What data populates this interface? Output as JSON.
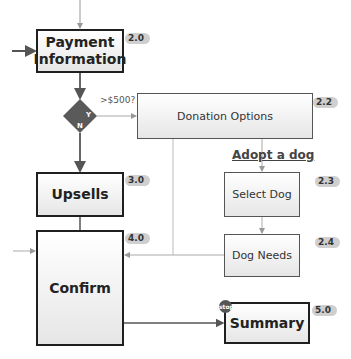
{
  "nodes": {
    "payment": {
      "label": "Payment Information",
      "line1": "Payment",
      "line2": "Information",
      "id": "2.0"
    },
    "decision": {
      "question": ">$500?",
      "yes": "Y",
      "no": "N"
    },
    "donation": {
      "label": "Donation Options",
      "id": "2.2"
    },
    "adopt_section": {
      "label": "Adopt a dog"
    },
    "select_dog": {
      "label": "Select Dog",
      "id": "2.3"
    },
    "dog_needs": {
      "label": "Dog Needs",
      "id": "2.4"
    },
    "upsells": {
      "label": "Upsells",
      "id": "3.0"
    },
    "confirm": {
      "label": "Confirm",
      "id": "4.0"
    },
    "summary": {
      "label": "Summary",
      "id": "5.0",
      "marker": "stop"
    }
  },
  "colors": {
    "line_dark": "#555555",
    "line_light": "#aaaaaa",
    "diamond": "#5a5a5a",
    "badge": "#cfcfcf"
  }
}
